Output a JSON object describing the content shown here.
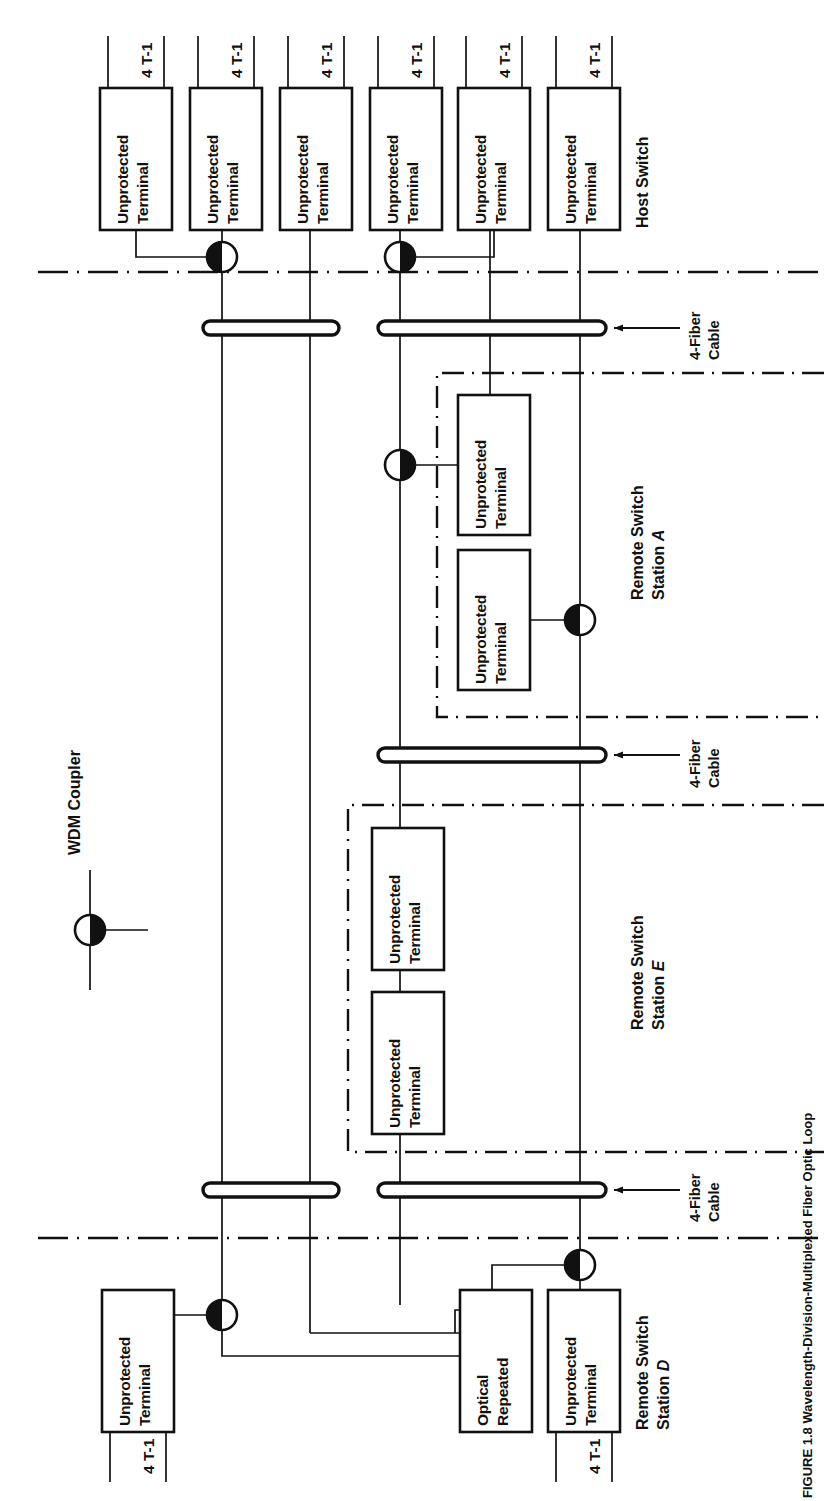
{
  "figure": {
    "caption": "FIGURE 1.8  Wavelength-Division-Multiplexed Fiber Optic Loop",
    "orientation": "rotated-90-ccw"
  },
  "legend": {
    "wdm_coupler_label": "WDM Coupler",
    "symbol": "half-filled-circle"
  },
  "labels": {
    "terminal": "Unprotected\nTerminal",
    "terminal_line1": "Unprotected",
    "terminal_line2": "Terminal",
    "optical_repeater_line1": "Optical",
    "optical_repeater_line2": "Repeated",
    "t1": "4 T-1",
    "fiber_cable_line1": "4-Fiber",
    "fiber_cable_line2": "Cable"
  },
  "stations": [
    {
      "id": "host",
      "name": "Host Switch",
      "name_plain": "Host Switch",
      "name_italic": "",
      "terminal_count": 6,
      "t1_count": 6,
      "coupler_count": 2
    },
    {
      "id": "rss-a",
      "name_line1": "Remote Switch",
      "name_line2_plain": "Station ",
      "name_line2_italic": "A",
      "terminal_count": 2,
      "coupler_count": 2
    },
    {
      "id": "rss-e",
      "name_line1": "Remote Switch",
      "name_line2_plain": "Station ",
      "name_line2_italic": "E",
      "terminal_count": 2,
      "coupler_count": 0
    },
    {
      "id": "rss-d",
      "name_line1": "Remote Switch",
      "name_line2_plain": "Station ",
      "name_line2_italic": "D",
      "terminal_count": 2,
      "repeater_count": 1,
      "coupler_count": 2
    }
  ],
  "cables": [
    {
      "id": "cable-1",
      "label_line1": "4-Fiber",
      "label_line2": "Cable"
    },
    {
      "id": "cable-2",
      "label_line1": "4-Fiber",
      "label_line2": "Cable"
    },
    {
      "id": "cable-3",
      "label_line1": "4-Fiber",
      "label_line2": "Cable"
    }
  ],
  "colors": {
    "ink": "#111111",
    "paper": "#ffffff"
  }
}
